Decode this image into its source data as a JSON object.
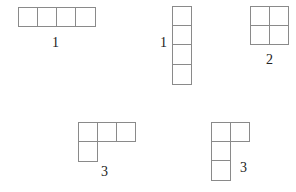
{
  "figure": {
    "cell_size": 19.5,
    "line_color": "#8a8a8a",
    "shapes": [
      {
        "id": "horizontal-bar",
        "label": "1",
        "cells": [
          [
            0,
            0
          ],
          [
            1,
            0
          ],
          [
            2,
            0
          ],
          [
            3,
            0
          ]
        ]
      },
      {
        "id": "vertical-bar",
        "label": "1",
        "cells": [
          [
            0,
            0
          ],
          [
            0,
            1
          ],
          [
            0,
            2
          ],
          [
            0,
            3
          ]
        ]
      },
      {
        "id": "square",
        "label": "2",
        "cells": [
          [
            0,
            0
          ],
          [
            1,
            0
          ],
          [
            0,
            1
          ],
          [
            1,
            1
          ]
        ]
      },
      {
        "id": "l-shape-wide",
        "label": "3",
        "cells": [
          [
            0,
            0
          ],
          [
            1,
            0
          ],
          [
            2,
            0
          ],
          [
            0,
            1
          ]
        ]
      },
      {
        "id": "l-shape-tall",
        "label": "3",
        "cells": [
          [
            0,
            0
          ],
          [
            1,
            0
          ],
          [
            0,
            1
          ],
          [
            0,
            2
          ]
        ]
      }
    ]
  }
}
